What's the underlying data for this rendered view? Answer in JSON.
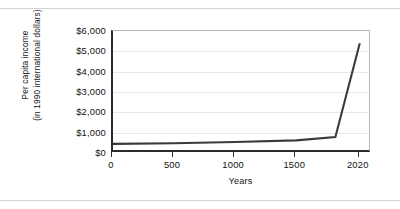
{
  "figure": {
    "background": "#ffffff",
    "line_color": "#3a3a3a",
    "grid_color": "#e9e9e9",
    "axis_color": "#2b2b2b"
  },
  "axes": {
    "ylabel_line1": "Per capita income",
    "ylabel_line2": "(in 1990 international dollars)",
    "xlabel": "Years"
  },
  "chart_data": {
    "type": "line",
    "title": "",
    "xlabel": "Years",
    "ylabel": "Per capita income (in 1990 international dollars)",
    "xlim": [
      0,
      2120
    ],
    "ylim": [
      0,
      6000
    ],
    "xticks": [
      0,
      500,
      1000,
      1500,
      2020
    ],
    "xtick_labels": [
      "0",
      "500",
      "1000",
      "1500",
      "2020"
    ],
    "yticks": [
      0,
      1000,
      2000,
      3000,
      4000,
      5000,
      6000
    ],
    "ytick_labels": [
      "$0",
      "$1,000",
      "$2,000",
      "$3,000",
      "$4,000",
      "$5,000",
      "$6,000"
    ],
    "grid": true,
    "grid_axis": "y",
    "legend": false,
    "series": [
      {
        "name": "World per capita income",
        "x": [
          0,
          500,
          1000,
          1500,
          1820,
          2020
        ],
        "y": [
          450,
          480,
          540,
          620,
          780,
          5400
        ]
      }
    ]
  }
}
